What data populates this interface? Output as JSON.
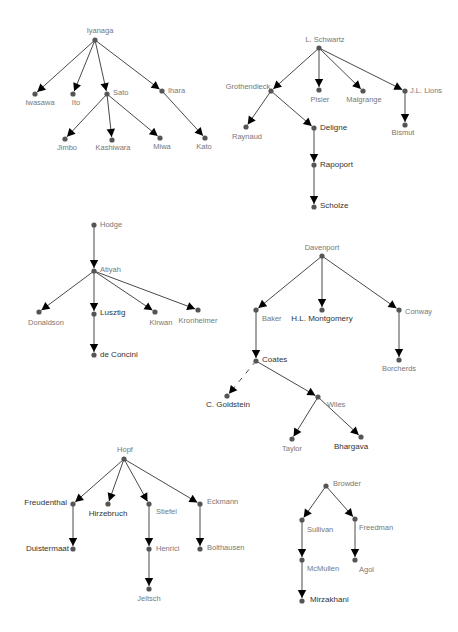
{
  "diagram": {
    "title": "",
    "type": "mathematical genealogy trees",
    "colors": {
      "edge": "#4a4a4a",
      "node": "#555555",
      "arrow": "#000000",
      "label_light": "#777777",
      "label_dark": "#333333"
    },
    "nodes": [
      {
        "id": "iyanaga",
        "label": "Iyanaga",
        "x": 95,
        "y": 40,
        "lx": 100,
        "ly": 31,
        "anchor": "middle",
        "tone": "light"
      },
      {
        "id": "iwasawa",
        "label": "Iwasawa",
        "x": 35,
        "y": 94,
        "lx": 40,
        "ly": 103,
        "anchor": "middle",
        "tone": "light"
      },
      {
        "id": "ito",
        "label": "Ito",
        "x": 73,
        "y": 94,
        "lx": 76,
        "ly": 103,
        "anchor": "middle",
        "tone": "light"
      },
      {
        "id": "sato",
        "label": "Sato",
        "x": 107,
        "y": 94,
        "lx": 113,
        "ly": 93,
        "anchor": "start",
        "tone": "light"
      },
      {
        "id": "ihara",
        "label": "Ihara",
        "x": 162,
        "y": 91,
        "lx": 168,
        "ly": 91,
        "anchor": "start",
        "tone": "light"
      },
      {
        "id": "jimbo",
        "label": "Jimbo",
        "x": 65,
        "y": 139,
        "lx": 67,
        "ly": 148,
        "anchor": "middle",
        "tone": "light"
      },
      {
        "id": "kashiwara",
        "label": "Kashiwara",
        "x": 112,
        "y": 140,
        "lx": 113,
        "ly": 148,
        "anchor": "middle",
        "tone": "light"
      },
      {
        "id": "miwa",
        "label": "Miwa",
        "x": 160,
        "y": 138,
        "lx": 162,
        "ly": 147,
        "anchor": "middle",
        "tone": "light"
      },
      {
        "id": "kato",
        "label": "Kato",
        "x": 205,
        "y": 138,
        "lx": 204,
        "ly": 147,
        "anchor": "middle",
        "tone": "light"
      },
      {
        "id": "lschwartz",
        "label": "L. Schwartz",
        "x": 319,
        "y": 48,
        "lx": 325,
        "ly": 40,
        "anchor": "middle",
        "tone": "light"
      },
      {
        "id": "grothendieck",
        "label": "Grothendieck",
        "x": 271,
        "y": 91,
        "lx": 248,
        "ly": 87,
        "anchor": "middle",
        "tone": "light"
      },
      {
        "id": "pisier",
        "label": "Pisier",
        "x": 319,
        "y": 90,
        "lx": 320,
        "ly": 100,
        "anchor": "middle",
        "tone": "light"
      },
      {
        "id": "malgrange",
        "label": "Malgrange",
        "x": 363,
        "y": 91,
        "lx": 364,
        "ly": 100,
        "anchor": "middle",
        "tone": "light"
      },
      {
        "id": "jllions",
        "label": "J.L. Lions",
        "x": 405,
        "y": 91,
        "lx": 410,
        "ly": 91,
        "anchor": "start",
        "tone": "light"
      },
      {
        "id": "raynaud",
        "label": "Raynaud",
        "x": 246,
        "y": 127,
        "lx": 247,
        "ly": 137,
        "anchor": "middle",
        "tone": "light"
      },
      {
        "id": "deligne",
        "label": "Deligne",
        "x": 314,
        "y": 128,
        "lx": 320,
        "ly": 128,
        "anchor": "start",
        "tone": "dark"
      },
      {
        "id": "rapoport",
        "label": "Rapoport",
        "x": 314,
        "y": 165,
        "lx": 320,
        "ly": 165,
        "anchor": "start",
        "tone": "dark"
      },
      {
        "id": "scholze",
        "label": "Scholze",
        "x": 314,
        "y": 207,
        "lx": 320,
        "ly": 206,
        "anchor": "start",
        "tone": "dark"
      },
      {
        "id": "bismut",
        "label": "Bismut",
        "x": 405,
        "y": 125,
        "lx": 403,
        "ly": 133,
        "anchor": "middle",
        "tone": "light"
      },
      {
        "id": "hodge",
        "label": "Hodge",
        "x": 94,
        "y": 225,
        "lx": 100,
        "ly": 225,
        "anchor": "start",
        "tone": "light"
      },
      {
        "id": "atiyah",
        "label": "Atiyah",
        "x": 94,
        "y": 271,
        "lx": 100,
        "ly": 270,
        "anchor": "start",
        "tone": "light"
      },
      {
        "id": "donaldson",
        "label": "Donaldson",
        "x": 39,
        "y": 312,
        "lx": 46,
        "ly": 323,
        "anchor": "middle",
        "tone": "light"
      },
      {
        "id": "lusztig",
        "label": "Lusztig",
        "x": 94,
        "y": 314,
        "lx": 100,
        "ly": 313,
        "anchor": "start",
        "tone": "dark"
      },
      {
        "id": "kirwan",
        "label": "Kirwan",
        "x": 155,
        "y": 312,
        "lx": 161,
        "ly": 323,
        "anchor": "middle",
        "tone": "light"
      },
      {
        "id": "kronheimer",
        "label": "Kronheimer",
        "x": 198,
        "y": 310,
        "lx": 198,
        "ly": 321,
        "anchor": "middle",
        "tone": "light"
      },
      {
        "id": "deconcini",
        "label": "de Concini",
        "x": 94,
        "y": 355,
        "lx": 100,
        "ly": 355,
        "anchor": "start",
        "tone": "dark"
      },
      {
        "id": "davenport",
        "label": "Davenport",
        "x": 322,
        "y": 256,
        "lx": 322,
        "ly": 248,
        "anchor": "middle",
        "tone": "light"
      },
      {
        "id": "baker",
        "label": "Baker",
        "x": 256,
        "y": 310,
        "lx": 262,
        "ly": 319,
        "anchor": "start",
        "tone": "light"
      },
      {
        "id": "hlmontgomery",
        "label": "H.L. Montgomery",
        "x": 322,
        "y": 310,
        "lx": 322,
        "ly": 319,
        "anchor": "middle",
        "tone": "dark"
      },
      {
        "id": "conway",
        "label": "Conway",
        "x": 399,
        "y": 310,
        "lx": 405,
        "ly": 312,
        "anchor": "start",
        "tone": "light"
      },
      {
        "id": "coates",
        "label": "Coates",
        "x": 256,
        "y": 361,
        "lx": 262,
        "ly": 360,
        "anchor": "start",
        "tone": "dark"
      },
      {
        "id": "borcherds",
        "label": "Borcherds",
        "x": 399,
        "y": 360,
        "lx": 399,
        "ly": 369,
        "anchor": "middle",
        "tone": "light"
      },
      {
        "id": "cgoldstein",
        "label": "C. Goldstein",
        "x": 227,
        "y": 396,
        "lx": 228,
        "ly": 405,
        "anchor": "middle",
        "tone": "dark"
      },
      {
        "id": "wiles",
        "label": "Wiles",
        "x": 318,
        "y": 397,
        "lx": 327,
        "ly": 405,
        "anchor": "start",
        "tone": "light"
      },
      {
        "id": "taylor",
        "label": "Taylor",
        "x": 292,
        "y": 439,
        "lx": 292,
        "ly": 449,
        "anchor": "middle",
        "tone": "light"
      },
      {
        "id": "bhargava",
        "label": "Bhargava",
        "x": 361,
        "y": 437,
        "lx": 351,
        "ly": 447,
        "anchor": "middle",
        "tone": "dark"
      },
      {
        "id": "hopf",
        "label": "Hopf",
        "x": 124,
        "y": 459,
        "lx": 125,
        "ly": 450,
        "anchor": "middle",
        "tone": "light"
      },
      {
        "id": "freudenthal",
        "label": "Freudenthal",
        "x": 73,
        "y": 504,
        "lx": 67,
        "ly": 503,
        "anchor": "end",
        "tone": "dark"
      },
      {
        "id": "hirzebruch",
        "label": "Hirzebruch",
        "x": 108,
        "y": 504,
        "lx": 108,
        "ly": 514,
        "anchor": "middle",
        "tone": "dark"
      },
      {
        "id": "stiefel",
        "label": "Stiefel",
        "x": 149,
        "y": 504,
        "lx": 156,
        "ly": 512,
        "anchor": "start",
        "tone": "light"
      },
      {
        "id": "eckmann",
        "label": "Eckmann",
        "x": 200,
        "y": 504,
        "lx": 207,
        "ly": 502,
        "anchor": "start",
        "tone": "light"
      },
      {
        "id": "duistermaat",
        "label": "Duistermaat",
        "x": 73,
        "y": 549,
        "lx": 69,
        "ly": 549,
        "anchor": "end",
        "tone": "dark"
      },
      {
        "id": "henrici",
        "label": "Henrici",
        "x": 149,
        "y": 549,
        "lx": 156,
        "ly": 549,
        "anchor": "start",
        "tone": "light"
      },
      {
        "id": "bolthausen",
        "label": "Bolthausen",
        "x": 200,
        "y": 549,
        "lx": 207,
        "ly": 548,
        "anchor": "start",
        "tone": "light"
      },
      {
        "id": "jeltsch",
        "label": "Jeltsch",
        "x": 149,
        "y": 589,
        "lx": 149,
        "ly": 599,
        "anchor": "middle",
        "tone": "light"
      },
      {
        "id": "browder",
        "label": "Browder",
        "x": 326,
        "y": 486,
        "lx": 333,
        "ly": 484,
        "anchor": "start",
        "tone": "light"
      },
      {
        "id": "sullivan",
        "label": "Sullivan",
        "x": 302,
        "y": 520,
        "lx": 307,
        "ly": 530,
        "anchor": "start",
        "tone": "light"
      },
      {
        "id": "freedman",
        "label": "Freedman",
        "x": 355,
        "y": 519,
        "lx": 359,
        "ly": 528,
        "anchor": "start",
        "tone": "light"
      },
      {
        "id": "mcmullen",
        "label": "McMullen",
        "x": 302,
        "y": 560,
        "lx": 307,
        "ly": 569,
        "anchor": "start",
        "tone": "light"
      },
      {
        "id": "agol",
        "label": "Agol",
        "x": 355,
        "y": 560,
        "lx": 359,
        "ly": 570,
        "anchor": "start",
        "tone": "light"
      },
      {
        "id": "mirzakhani",
        "label": "Mirzakhani",
        "x": 302,
        "y": 601,
        "lx": 310,
        "ly": 600,
        "anchor": "start",
        "tone": "dark"
      }
    ],
    "edges": [
      {
        "from": "iyanaga",
        "to": "iwasawa"
      },
      {
        "from": "iyanaga",
        "to": "ito"
      },
      {
        "from": "iyanaga",
        "to": "sato"
      },
      {
        "from": "iyanaga",
        "to": "ihara"
      },
      {
        "from": "sato",
        "to": "jimbo"
      },
      {
        "from": "sato",
        "to": "kashiwara"
      },
      {
        "from": "sato",
        "to": "miwa"
      },
      {
        "from": "ihara",
        "to": "kato"
      },
      {
        "from": "lschwartz",
        "to": "grothendieck"
      },
      {
        "from": "lschwartz",
        "to": "pisier"
      },
      {
        "from": "lschwartz",
        "to": "malgrange"
      },
      {
        "from": "lschwartz",
        "to": "jllions"
      },
      {
        "from": "grothendieck",
        "to": "raynaud"
      },
      {
        "from": "grothendieck",
        "to": "deligne"
      },
      {
        "from": "deligne",
        "to": "rapoport"
      },
      {
        "from": "rapoport",
        "to": "scholze"
      },
      {
        "from": "jllions",
        "to": "bismut"
      },
      {
        "from": "hodge",
        "to": "atiyah"
      },
      {
        "from": "atiyah",
        "to": "donaldson"
      },
      {
        "from": "atiyah",
        "to": "lusztig"
      },
      {
        "from": "atiyah",
        "to": "kirwan"
      },
      {
        "from": "atiyah",
        "to": "kronheimer"
      },
      {
        "from": "lusztig",
        "to": "deconcini"
      },
      {
        "from": "davenport",
        "to": "baker"
      },
      {
        "from": "davenport",
        "to": "hlmontgomery"
      },
      {
        "from": "davenport",
        "to": "conway"
      },
      {
        "from": "baker",
        "to": "coates"
      },
      {
        "from": "conway",
        "to": "borcherds"
      },
      {
        "from": "coates",
        "to": "cgoldstein",
        "dashed": true
      },
      {
        "from": "coates",
        "to": "wiles"
      },
      {
        "from": "wiles",
        "to": "taylor"
      },
      {
        "from": "wiles",
        "to": "bhargava"
      },
      {
        "from": "hopf",
        "to": "freudenthal"
      },
      {
        "from": "hopf",
        "to": "hirzebruch"
      },
      {
        "from": "hopf",
        "to": "stiefel"
      },
      {
        "from": "hopf",
        "to": "eckmann"
      },
      {
        "from": "freudenthal",
        "to": "duistermaat"
      },
      {
        "from": "stiefel",
        "to": "henrici"
      },
      {
        "from": "henrici",
        "to": "jeltsch"
      },
      {
        "from": "eckmann",
        "to": "bolthausen"
      },
      {
        "from": "browder",
        "to": "sullivan"
      },
      {
        "from": "browder",
        "to": "freedman"
      },
      {
        "from": "sullivan",
        "to": "mcmullen"
      },
      {
        "from": "freedman",
        "to": "agol"
      },
      {
        "from": "mcmullen",
        "to": "mirzakhani"
      }
    ]
  }
}
